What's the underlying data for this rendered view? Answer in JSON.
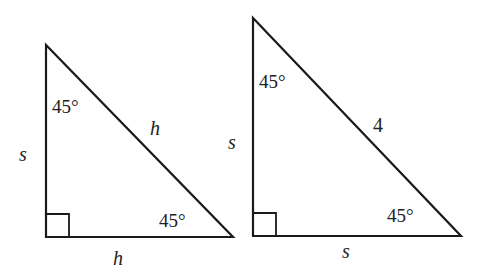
{
  "diagram": {
    "stroke_color": "#1a1a1a",
    "text_color": "#222222",
    "triangles": [
      {
        "id": "left",
        "vertices": {
          "top": [
            46,
            45
          ],
          "right_angle": [
            46,
            237
          ],
          "right": [
            233,
            237
          ]
        },
        "angles": {
          "top": "45°",
          "bottom_right": "45°",
          "right_angle_marker": true
        },
        "labels": {
          "vertical_side": "s",
          "hypotenuse": "h",
          "horizontal_side": "h"
        }
      },
      {
        "id": "right",
        "vertices": {
          "top": [
            253,
            18
          ],
          "right_angle": [
            253,
            236
          ],
          "right": [
            461,
            236
          ]
        },
        "angles": {
          "top": "45°",
          "bottom_right": "45°",
          "right_angle_marker": true
        },
        "labels": {
          "vertical_side": "s",
          "hypotenuse": "4",
          "horizontal_side": "s"
        }
      }
    ]
  }
}
